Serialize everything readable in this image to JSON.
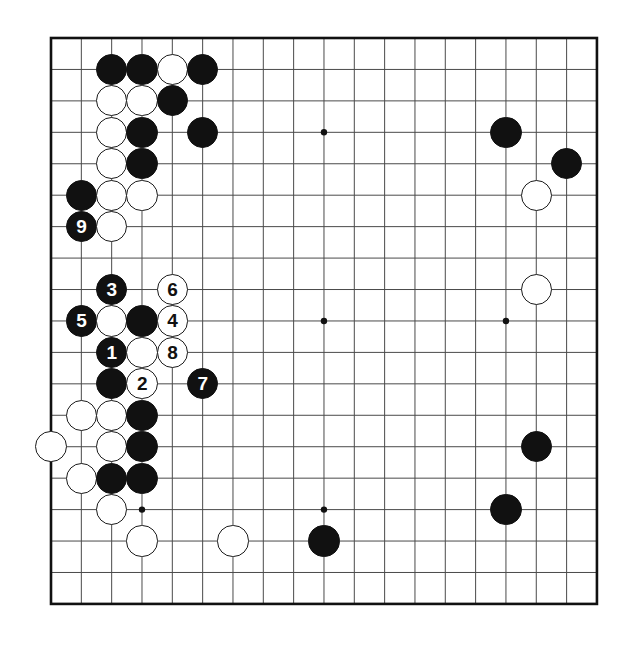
{
  "diagram": {
    "type": "go-board-diagram",
    "board_size": 19,
    "geometry": {
      "left": 51,
      "top": 38,
      "col_spacing": 30.33,
      "row_spacing": 31.44,
      "stone_radius": 15.6,
      "border_width": 2.6,
      "line_width": 1,
      "line_color": "#4a4a4a",
      "border_color": "#111111",
      "background": "#ffffff"
    },
    "star_points": [
      {
        "col": 3,
        "row": 3
      },
      {
        "col": 9,
        "row": 3
      },
      {
        "col": 15,
        "row": 3
      },
      {
        "col": 3,
        "row": 9
      },
      {
        "col": 9,
        "row": 9
      },
      {
        "col": 15,
        "row": 9
      },
      {
        "col": 3,
        "row": 15
      },
      {
        "col": 9,
        "row": 15
      },
      {
        "col": 15,
        "row": 15
      }
    ],
    "colors": {
      "black_stone": "#111111",
      "white_stone": "#ffffff",
      "white_stone_outline": "#1a1a1a",
      "black_label": "#ffffff",
      "white_label": "#111111"
    },
    "move_labels": [
      "1",
      "2",
      "3",
      "4",
      "5",
      "6",
      "7",
      "8",
      "9"
    ],
    "stones": [
      {
        "col": 2,
        "row": 1,
        "color": "black",
        "label": ""
      },
      {
        "col": 3,
        "row": 1,
        "color": "black",
        "label": ""
      },
      {
        "col": 4,
        "row": 1,
        "color": "white",
        "label": ""
      },
      {
        "col": 5,
        "row": 1,
        "color": "black",
        "label": ""
      },
      {
        "col": 2,
        "row": 2,
        "color": "white",
        "label": ""
      },
      {
        "col": 3,
        "row": 2,
        "color": "white",
        "label": ""
      },
      {
        "col": 4,
        "row": 2,
        "color": "black",
        "label": ""
      },
      {
        "col": 2,
        "row": 3,
        "color": "white",
        "label": ""
      },
      {
        "col": 3,
        "row": 3,
        "color": "black",
        "label": ""
      },
      {
        "col": 5,
        "row": 3,
        "color": "black",
        "label": ""
      },
      {
        "col": 15,
        "row": 3,
        "color": "black",
        "label": ""
      },
      {
        "col": 2,
        "row": 4,
        "color": "white",
        "label": ""
      },
      {
        "col": 3,
        "row": 4,
        "color": "black",
        "label": ""
      },
      {
        "col": 17,
        "row": 4,
        "color": "black",
        "label": ""
      },
      {
        "col": 1,
        "row": 5,
        "color": "black",
        "label": ""
      },
      {
        "col": 2,
        "row": 5,
        "color": "white",
        "label": ""
      },
      {
        "col": 3,
        "row": 5,
        "color": "white",
        "label": ""
      },
      {
        "col": 16,
        "row": 5,
        "color": "white",
        "label": ""
      },
      {
        "col": 1,
        "row": 6,
        "color": "black",
        "label": "9"
      },
      {
        "col": 2,
        "row": 6,
        "color": "white",
        "label": ""
      },
      {
        "col": 2,
        "row": 8,
        "color": "black",
        "label": "3"
      },
      {
        "col": 4,
        "row": 8,
        "color": "white",
        "label": "6"
      },
      {
        "col": 16,
        "row": 8,
        "color": "white",
        "label": ""
      },
      {
        "col": 1,
        "row": 9,
        "color": "black",
        "label": "5"
      },
      {
        "col": 2,
        "row": 9,
        "color": "white",
        "label": ""
      },
      {
        "col": 3,
        "row": 9,
        "color": "black",
        "label": ""
      },
      {
        "col": 4,
        "row": 9,
        "color": "white",
        "label": "4"
      },
      {
        "col": 2,
        "row": 10,
        "color": "black",
        "label": "1"
      },
      {
        "col": 3,
        "row": 10,
        "color": "white",
        "label": ""
      },
      {
        "col": 4,
        "row": 10,
        "color": "white",
        "label": "8"
      },
      {
        "col": 2,
        "row": 11,
        "color": "black",
        "label": ""
      },
      {
        "col": 3,
        "row": 11,
        "color": "white",
        "label": "2"
      },
      {
        "col": 5,
        "row": 11,
        "color": "black",
        "label": "7"
      },
      {
        "col": 1,
        "row": 12,
        "color": "white",
        "label": ""
      },
      {
        "col": 2,
        "row": 12,
        "color": "white",
        "label": ""
      },
      {
        "col": 3,
        "row": 12,
        "color": "black",
        "label": ""
      },
      {
        "col": 0,
        "row": 13,
        "color": "white",
        "label": ""
      },
      {
        "col": 2,
        "row": 13,
        "color": "white",
        "label": ""
      },
      {
        "col": 3,
        "row": 13,
        "color": "black",
        "label": ""
      },
      {
        "col": 16,
        "row": 13,
        "color": "black",
        "label": ""
      },
      {
        "col": 1,
        "row": 14,
        "color": "white",
        "label": ""
      },
      {
        "col": 2,
        "row": 14,
        "color": "black",
        "label": ""
      },
      {
        "col": 3,
        "row": 14,
        "color": "black",
        "label": ""
      },
      {
        "col": 2,
        "row": 15,
        "color": "white",
        "label": ""
      },
      {
        "col": 15,
        "row": 15,
        "color": "black",
        "label": ""
      },
      {
        "col": 3,
        "row": 16,
        "color": "white",
        "label": ""
      },
      {
        "col": 6,
        "row": 16,
        "color": "white",
        "label": ""
      },
      {
        "col": 9,
        "row": 16,
        "color": "black",
        "label": ""
      }
    ]
  }
}
